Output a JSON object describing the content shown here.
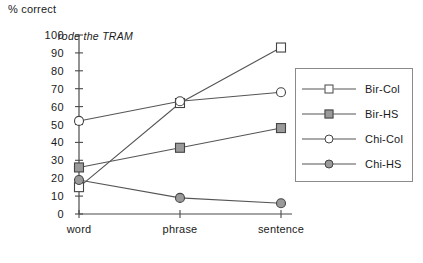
{
  "chart_data": {
    "type": "line",
    "title": "",
    "annotation": "rode the TRAM",
    "xlabel": "",
    "ylabel": "% correct",
    "categories": [
      "word",
      "phrase",
      "sentence"
    ],
    "ylim": [
      0,
      100
    ],
    "yticks": [
      0,
      10,
      20,
      30,
      40,
      50,
      60,
      70,
      80,
      90,
      100
    ],
    "ytick_labels": [
      "0",
      "10",
      "20",
      "30",
      "40",
      "50",
      "60",
      "70",
      "80",
      "90",
      "100"
    ],
    "grid": false,
    "legend_position": "right",
    "series": [
      {
        "name": "Bir-Col",
        "values": [
          15,
          62,
          93
        ],
        "marker": "square-open",
        "marker_fill": "#ffffff",
        "line_color": "#555555"
      },
      {
        "name": "Bir-HS",
        "values": [
          26,
          37,
          48
        ],
        "marker": "square-filled",
        "marker_fill": "#9a9a9a",
        "line_color": "#555555"
      },
      {
        "name": "Chi-Col",
        "values": [
          52,
          63,
          68
        ],
        "marker": "circle-open",
        "marker_fill": "#ffffff",
        "line_color": "#555555"
      },
      {
        "name": "Chi-HS",
        "values": [
          19,
          9,
          6
        ],
        "marker": "circle-filled",
        "marker_fill": "#9a9a9a",
        "line_color": "#555555"
      }
    ]
  },
  "legend": {
    "items": [
      {
        "label": "Bir-Col"
      },
      {
        "label": "Bir-HS"
      },
      {
        "label": "Chi-Col"
      },
      {
        "label": "Chi-HS"
      }
    ]
  },
  "colors": {
    "axis": "#4a4a4a",
    "line": "#555555",
    "marker_edge": "#444444",
    "marker_fill_open": "#ffffff",
    "marker_fill_solid": "#9a9a9a",
    "text": "#1a1a1a",
    "legend_border": "#8a8a8a"
  }
}
